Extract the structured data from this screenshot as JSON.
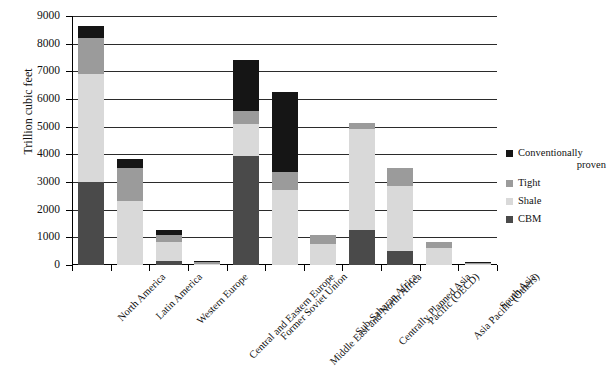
{
  "chart_data": {
    "type": "bar",
    "subtype": "stacked-vertical",
    "title": "",
    "xlabel": "",
    "ylabel": "Trillion cubic feet",
    "ylim": [
      0,
      9000
    ],
    "ytick_step": 1000,
    "yticks": [
      0,
      1000,
      2000,
      3000,
      4000,
      5000,
      6000,
      7000,
      8000,
      9000
    ],
    "ytick_labels": [
      "0",
      "1000",
      "2000",
      "3000",
      "4000",
      "5000",
      "6000",
      "7000",
      "8000",
      "9000"
    ],
    "grid": "horizontal",
    "legend_position": "right",
    "stack_order_bottom_to_top": [
      "CBM",
      "Shale",
      "Tight",
      "Conventionally proven"
    ],
    "categories": [
      "North America",
      "Latin America",
      "Western Europe",
      "Central and Eastern Europe",
      "Former Soviet Union",
      "Middle East and North Africa",
      "Sub-Saharan Africa",
      "Centrally Planned Asia",
      "Pacific (OECD)",
      "Asia Pacific (Others)",
      "South Asia"
    ],
    "series": [
      {
        "name": "Conventionally proven",
        "color": "#151515",
        "values": [
          450,
          330,
          150,
          60,
          1850,
          2900,
          0,
          0,
          0,
          0,
          30
        ]
      },
      {
        "name": "Tight",
        "color": "#9b9b9b",
        "values": [
          1300,
          1200,
          250,
          60,
          450,
          650,
          330,
          250,
          650,
          220,
          50
        ]
      },
      {
        "name": "Shale",
        "color": "#d9d9d9",
        "values": [
          3900,
          2300,
          700,
          30,
          1150,
          2700,
          750,
          3650,
          2350,
          600,
          40
        ]
      },
      {
        "name": "CBM",
        "color": "#4a4a4a",
        "values": [
          3000,
          0,
          150,
          0,
          3950,
          0,
          0,
          1250,
          500,
          0,
          0
        ]
      }
    ],
    "totals": [
      8650,
      3830,
      1250,
      150,
      7400,
      6250,
      1080,
      5150,
      3500,
      820,
      120
    ]
  },
  "legend": {
    "items": [
      {
        "label_line1": "Conventionally",
        "label_line2": "proven",
        "color": "#151515"
      },
      {
        "label_line1": "Tight",
        "label_line2": "",
        "color": "#9b9b9b"
      },
      {
        "label_line1": "Shale",
        "label_line2": "",
        "color": "#d9d9d9"
      },
      {
        "label_line1": "CBM",
        "label_line2": "",
        "color": "#4a4a4a"
      }
    ]
  }
}
